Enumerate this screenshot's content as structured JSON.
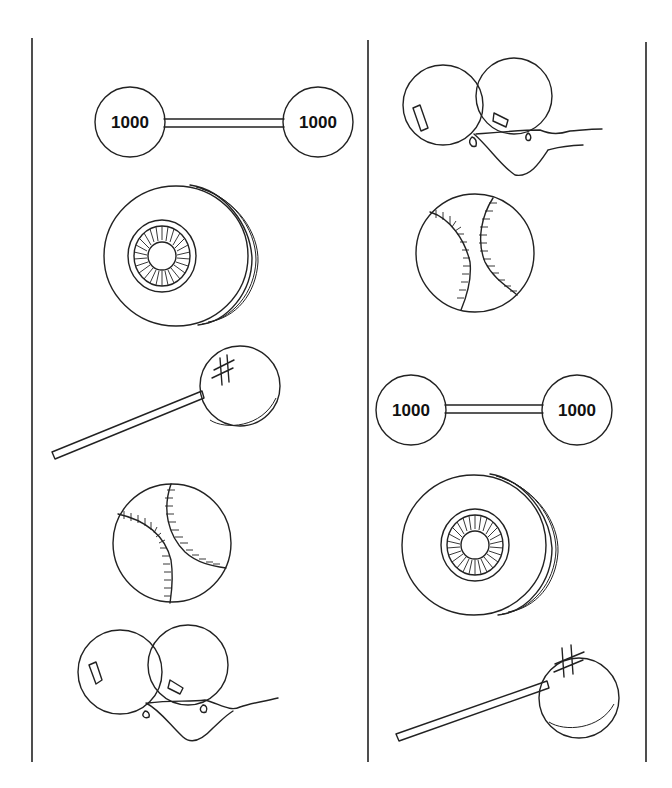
{
  "page": {
    "columns": [
      {
        "items": [
          {
            "type": "barbell",
            "left_label": "1000",
            "right_label": "1000"
          },
          {
            "type": "tire"
          },
          {
            "type": "lollipop",
            "mark": "#"
          },
          {
            "type": "baseball"
          },
          {
            "type": "balloons",
            "count": 2
          }
        ]
      },
      {
        "items": [
          {
            "type": "balloons",
            "count": 2
          },
          {
            "type": "baseball"
          },
          {
            "type": "barbell",
            "left_label": "1000",
            "right_label": "1000"
          },
          {
            "type": "tire"
          },
          {
            "type": "lollipop",
            "mark": "#"
          }
        ]
      }
    ],
    "colors": {
      "ink": "#222222",
      "paper": "#ffffff"
    }
  }
}
